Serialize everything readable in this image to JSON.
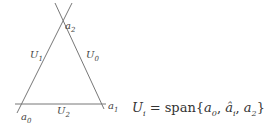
{
  "diagram": {
    "lines": [
      {
        "name": "U1-line",
        "x1": 17,
        "y1": 113,
        "x2": 72,
        "y2": 3
      },
      {
        "name": "U0-line",
        "x1": 55,
        "y1": 3,
        "x2": 104,
        "y2": 109
      },
      {
        "name": "U2-line",
        "x1": 15,
        "y1": 104,
        "x2": 106,
        "y2": 104
      }
    ],
    "stroke_color": "#777777",
    "vertices": {
      "a0": {
        "base": "a",
        "sub": "0"
      },
      "a1": {
        "base": "a",
        "sub": "1"
      },
      "a2": {
        "base": "a",
        "sub": "2"
      }
    },
    "edges": {
      "U0": {
        "base": "U",
        "sub": "0"
      },
      "U1": {
        "base": "U",
        "sub": "1"
      },
      "U2": {
        "base": "U",
        "sub": "2"
      }
    }
  },
  "formula": {
    "lhs_base": "U",
    "lhs_sub": "i",
    "equals": " = span{",
    "t1_base": "a",
    "t1_sub": "0",
    "sep1": ", ",
    "t2_base": "â",
    "t2_sub": "i",
    "sep2": ", ",
    "t3_base": "a",
    "t3_sub": "2",
    "close": "}"
  }
}
